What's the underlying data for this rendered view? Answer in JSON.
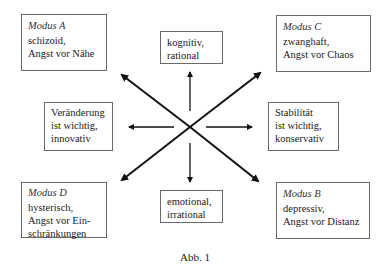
{
  "diagram": {
    "modes": [
      {
        "id": "A",
        "title": "Modus A",
        "lines": [
          "schizoid,",
          "Angst vor Nähe"
        ]
      },
      {
        "id": "C",
        "title": "Modus C",
        "lines": [
          "zwanghaft,",
          "Angst vor Chaos"
        ]
      },
      {
        "id": "D",
        "title": "Modus D",
        "lines": [
          "hysterisch,",
          "Angst vor Ein-",
          "schränkungen"
        ]
      },
      {
        "id": "B",
        "title": "Modus B",
        "lines": [
          "depressiv,",
          "Angst vor Distanz"
        ]
      }
    ],
    "axes": {
      "top": {
        "lines": [
          "kognitiv,",
          "rational"
        ]
      },
      "bottom": {
        "lines": [
          "emotional,",
          "irrational"
        ]
      },
      "left": {
        "lines": [
          "Veränderung",
          "ist wichtig,",
          "innovativ"
        ]
      },
      "right": {
        "lines": [
          "Stabilität",
          "ist wichtig,",
          "konservativ"
        ]
      }
    },
    "caption": "Abb. 1",
    "colors": {
      "line": "#111111",
      "border": "#6a6a6a"
    }
  }
}
